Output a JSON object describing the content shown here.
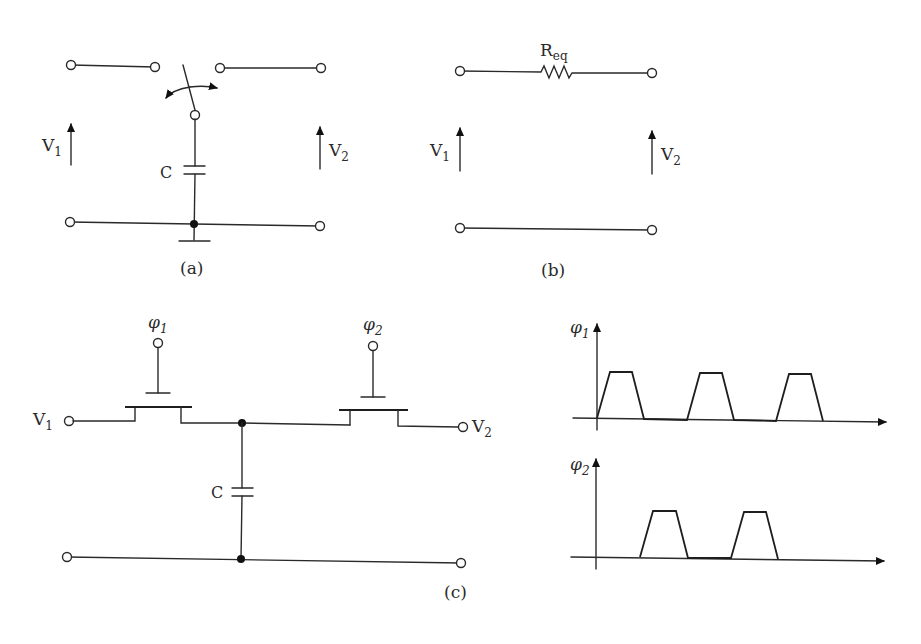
{
  "figure": {
    "panels": [
      {
        "id": "a",
        "caption": "(a)",
        "labels": {
          "v_in": "V",
          "v_in_sub": "1",
          "v_out": "V",
          "v_out_sub": "2",
          "capacitor": "C"
        },
        "components": [
          "switch",
          "capacitor",
          "ground"
        ]
      },
      {
        "id": "b",
        "caption": "(b)",
        "labels": {
          "resistor": "R",
          "resistor_sub": "eq",
          "v_in": "V",
          "v_in_sub": "1",
          "v_out": "V",
          "v_out_sub": "2"
        },
        "components": [
          "resistor"
        ]
      },
      {
        "id": "c",
        "caption": "(c)",
        "labels": {
          "v_in": "V",
          "v_in_sub": "1",
          "v_out": "V",
          "v_out_sub": "2",
          "capacitor": "C",
          "gate1": "φ",
          "gate1_sub": "1",
          "gate2": "φ",
          "gate2_sub": "2"
        },
        "components": [
          "transistor-phi1",
          "transistor-phi2",
          "capacitor"
        ]
      }
    ],
    "waveforms": [
      {
        "name": "φ",
        "sub": "1",
        "pulses": 3,
        "shape": "trapezoid",
        "start_offset": 0
      },
      {
        "name": "φ",
        "sub": "2",
        "pulses": 2,
        "shape": "trapezoid",
        "start_offset": "half-period"
      }
    ]
  }
}
